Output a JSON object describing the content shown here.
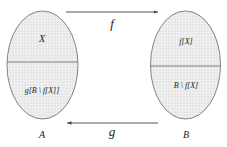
{
  "diagram": {
    "type": "set-mapping",
    "sets": [
      {
        "name": "A",
        "regions": [
          {
            "label": "X"
          },
          {
            "label": "g[B \\ f[X]]"
          }
        ]
      },
      {
        "name": "B",
        "regions": [
          {
            "label": "f[X]"
          },
          {
            "label": "B \\ f[X]"
          }
        ]
      }
    ],
    "arrows": [
      {
        "label": "f",
        "from": "A",
        "to": "B"
      },
      {
        "label": "g",
        "from": "B",
        "to": "A"
      }
    ],
    "colors": {
      "stroke": "#555555",
      "fill": "#e6e6e6",
      "text": "#222222"
    }
  }
}
